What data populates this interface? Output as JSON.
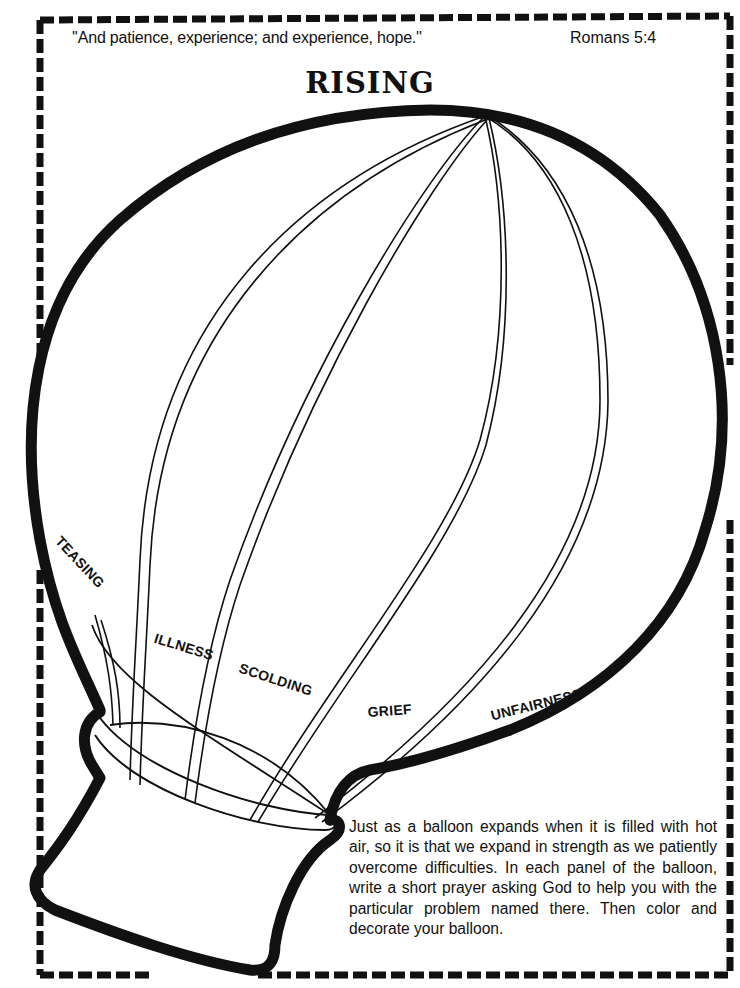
{
  "header": {
    "quote": "''And patience, experience; and experience, hope.''",
    "reference": "Romans 5:4",
    "title": "RISING"
  },
  "balloon": {
    "panel_labels": [
      "TEASING",
      "ILLNESS",
      "SCOLDING",
      "GRIEF",
      "UNFAIRNESS"
    ]
  },
  "instructions": {
    "text": "Just as a balloon expands when it is filled with hot air, so it is that we expand in strength as we patiently overcome difficulties. In each panel of the balloon, write a short prayer asking God to help you with the particular problem named there. Then color and decorate your balloon."
  },
  "colors": {
    "ink": "#111111",
    "paper": "#ffffff"
  }
}
